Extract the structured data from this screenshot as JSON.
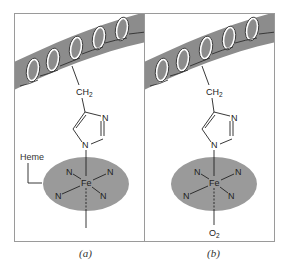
{
  "figure": {
    "colors": {
      "background": "#ffffff",
      "panel_border": "#9a9a9a",
      "helix_band": "#8c8c8c",
      "heme_disc": "#9a9a9a",
      "bond": "#222222"
    },
    "panels": [
      {
        "id": "a",
        "caption": "(a)",
        "group_label": "CH",
        "group_sub": "2",
        "heme_label": "Heme",
        "ring_atoms": {
          "n3": "N",
          "n1": "N"
        },
        "iron": "Fe",
        "ligands": [
          "N",
          "N",
          "N",
          "N"
        ],
        "sixth_ligand": "",
        "sixth_sub": ""
      },
      {
        "id": "b",
        "caption": "(b)",
        "group_label": "CH",
        "group_sub": "2",
        "heme_label": "",
        "ring_atoms": {
          "n3": "N",
          "n1": "N"
        },
        "iron": "Fe",
        "ligands": [
          "N",
          "N",
          "N",
          "N"
        ],
        "sixth_ligand": "O",
        "sixth_sub": "2"
      }
    ]
  }
}
